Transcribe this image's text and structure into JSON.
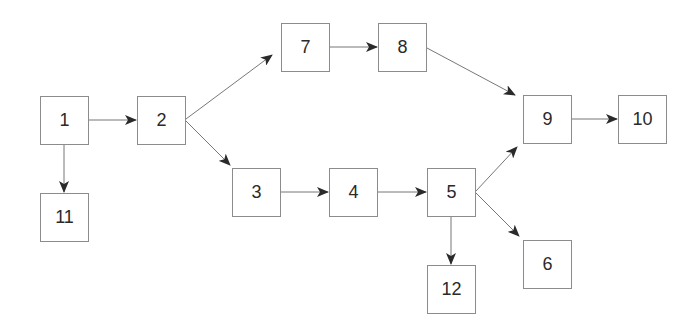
{
  "diagram": {
    "type": "directed-graph",
    "colors": {
      "box_border": "#8c8c8c",
      "edge": "#777777",
      "arrowhead": "#2a2a2a",
      "text": "#2a2a2a",
      "background": "#ffffff"
    },
    "nodes": [
      {
        "id": "1",
        "label": "1",
        "x": 40,
        "y": 96
      },
      {
        "id": "2",
        "label": "2",
        "x": 137,
        "y": 96
      },
      {
        "id": "7",
        "label": "7",
        "x": 281,
        "y": 23
      },
      {
        "id": "8",
        "label": "8",
        "x": 378,
        "y": 23
      },
      {
        "id": "9",
        "label": "9",
        "x": 523,
        "y": 95
      },
      {
        "id": "10",
        "label": "10",
        "x": 618,
        "y": 95
      },
      {
        "id": "11",
        "label": "11",
        "x": 40,
        "y": 193
      },
      {
        "id": "3",
        "label": "3",
        "x": 232,
        "y": 168
      },
      {
        "id": "4",
        "label": "4",
        "x": 329,
        "y": 168
      },
      {
        "id": "5",
        "label": "5",
        "x": 427,
        "y": 168
      },
      {
        "id": "12",
        "label": "12",
        "x": 427,
        "y": 265
      },
      {
        "id": "6",
        "label": "6",
        "x": 523,
        "y": 240
      }
    ],
    "edges": [
      {
        "from": "1",
        "to": "2"
      },
      {
        "from": "1",
        "to": "11"
      },
      {
        "from": "2",
        "to": "7"
      },
      {
        "from": "2",
        "to": "3"
      },
      {
        "from": "7",
        "to": "8"
      },
      {
        "from": "8",
        "to": "9"
      },
      {
        "from": "9",
        "to": "10"
      },
      {
        "from": "3",
        "to": "4"
      },
      {
        "from": "4",
        "to": "5"
      },
      {
        "from": "5",
        "to": "9"
      },
      {
        "from": "5",
        "to": "6"
      },
      {
        "from": "5",
        "to": "12"
      }
    ]
  }
}
